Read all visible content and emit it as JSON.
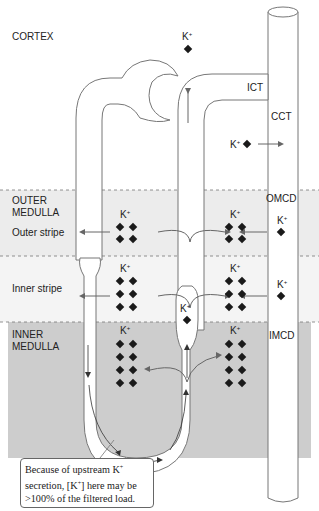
{
  "zones": {
    "cortex": "CORTEX",
    "outer_medulla_line1": "OUTER",
    "outer_medulla_line2": "MEDULLA",
    "outer_stripe": "Outer stripe",
    "inner_stripe": "Inner stripe",
    "inner_medulla_line1": "INNER",
    "inner_medulla_line2": "MEDULLA"
  },
  "segments": {
    "ict": "ICT",
    "cct": "CCT",
    "omcd": "OMCD",
    "imcd": "IMCD"
  },
  "ion": {
    "symbol": "K",
    "charge": "+"
  },
  "callout": {
    "line1_pre": "Because of upstream K",
    "line1_sup": "+",
    "line2_pre": "secretion, [K",
    "line2_sup": "+",
    "line2_post": "] here may be",
    "line3": ">100% of the filtered load."
  },
  "colors": {
    "outer_stripe_bg": "#ececec",
    "inner_stripe_bg": "#f2f2f2",
    "inner_medulla_bg": "#cfcfcf",
    "outline": "#777777",
    "diamond": "#1a1a1a"
  }
}
